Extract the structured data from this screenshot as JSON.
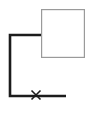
{
  "canvas": {
    "width": 93,
    "height": 122,
    "background": "#ffffff"
  },
  "diagram": {
    "node": {
      "name": "square-node",
      "label": "",
      "shape": "rectangle",
      "x": 41,
      "y": 9,
      "width": 44,
      "height": 49,
      "stroke": "#9a9a9a",
      "stroke_width": 1.2,
      "fill": "#ffffff"
    },
    "connector": {
      "name": "elbow-connector",
      "stroke": "#1c1c1c",
      "stroke_width": 2.6,
      "points": [
        {
          "x": 41,
          "y": 35
        },
        {
          "x": 10,
          "y": 35
        },
        {
          "x": 10,
          "y": 96
        },
        {
          "x": 66,
          "y": 96
        }
      ]
    },
    "marker": {
      "name": "x-marker",
      "glyph": "×",
      "x": 36,
      "y": 95,
      "size": 9,
      "stroke": "#1c1c1c",
      "stroke_width": 1.6
    }
  }
}
